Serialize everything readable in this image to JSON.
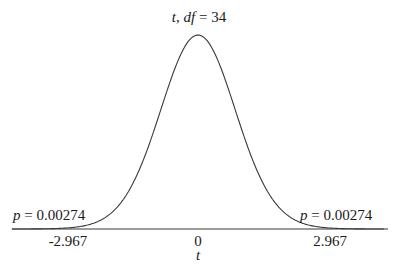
{
  "chart_data": {
    "type": "line",
    "title": "t, df = 34",
    "title_parts": {
      "var": "t",
      "sep": ", ",
      "df_label": "df",
      "eq": " = ",
      "df_value": "34"
    },
    "distribution": "Student t",
    "df": 34,
    "xlabel": "t",
    "ylabel": "",
    "xlim": [
      -4.9,
      4.9
    ],
    "critical_values": [
      -2.967,
      2.967
    ],
    "x_ticks": [
      {
        "value": -2.967,
        "label": "-2.967"
      },
      {
        "value": 0,
        "label": "0"
      },
      {
        "value": 2.967,
        "label": "2.967"
      }
    ],
    "annotations": [
      {
        "side": "left",
        "var": "p",
        "text": " = 0.00274",
        "value": 0.00274
      },
      {
        "side": "right",
        "var": "p",
        "text": " = 0.00274",
        "value": 0.00274
      }
    ],
    "grid": false,
    "legend": null,
    "line_color": "#3a3a3a"
  }
}
